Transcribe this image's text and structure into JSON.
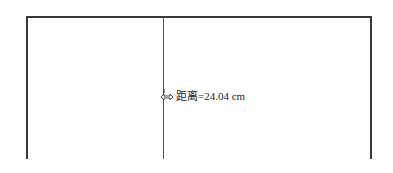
{
  "measurement": {
    "label": "距离",
    "separator": "=",
    "value": "24.04",
    "unit": "cm",
    "display": "距离=24.04 cm"
  },
  "cursor": {
    "icon": "move-arrows-icon"
  },
  "colors": {
    "line": "#3a3a3a",
    "guide": "#555555",
    "text": "#222222",
    "background": "#ffffff"
  }
}
